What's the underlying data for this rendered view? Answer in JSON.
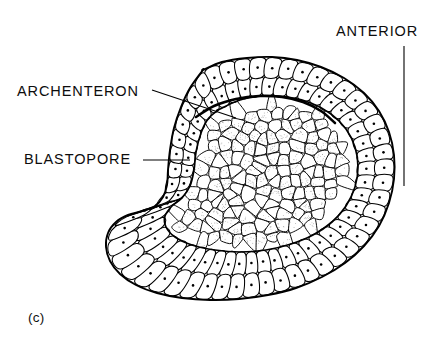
{
  "figure": {
    "panel_letter": "(c)",
    "background_color": "#ffffff",
    "ink_color": "#000000",
    "stipple_color": "#8a8a8a"
  },
  "labels": [
    {
      "id": "archenteron",
      "text": "ARCHENTERON",
      "text_x": 17,
      "text_y": 84,
      "leader": {
        "x1": 152,
        "y1": 90,
        "x2": 236,
        "y2": 118
      }
    },
    {
      "id": "blastopore",
      "text": "BLASTOPORE",
      "text_x": 24,
      "text_y": 152,
      "leader": {
        "x1": 143,
        "y1": 160,
        "x2": 190,
        "y2": 160
      }
    },
    {
      "id": "anterior",
      "text": "ANTERIOR",
      "text_x": 336,
      "text_y": 24,
      "leader": {
        "x1": 404,
        "y1": 46,
        "x2": 404,
        "y2": 186
      }
    }
  ],
  "drawing": {
    "outer_outline": [
      [
        203,
        70
      ],
      [
        222,
        62
      ],
      [
        247,
        58
      ],
      [
        272,
        57
      ],
      [
        297,
        60
      ],
      [
        321,
        67
      ],
      [
        344,
        78
      ],
      [
        364,
        93
      ],
      [
        379,
        111
      ],
      [
        389,
        132
      ],
      [
        394,
        155
      ],
      [
        394,
        179
      ],
      [
        389,
        203
      ],
      [
        379,
        226
      ],
      [
        364,
        246
      ],
      [
        345,
        263
      ],
      [
        322,
        277
      ],
      [
        296,
        288
      ],
      [
        268,
        295
      ],
      [
        239,
        299
      ],
      [
        210,
        300
      ],
      [
        182,
        298
      ],
      [
        157,
        293
      ],
      [
        136,
        285
      ],
      [
        120,
        274
      ],
      [
        110,
        261
      ],
      [
        106,
        247
      ],
      [
        108,
        233
      ],
      [
        116,
        222
      ],
      [
        128,
        215
      ],
      [
        142,
        211
      ],
      [
        155,
        206
      ],
      [
        163,
        197
      ],
      [
        167,
        185
      ],
      [
        168,
        170
      ],
      [
        170,
        150
      ],
      [
        174,
        128
      ],
      [
        181,
        107
      ],
      [
        190,
        88
      ],
      [
        203,
        70
      ]
    ],
    "inner_mass_outline": [
      [
        218,
        110
      ],
      [
        240,
        100
      ],
      [
        264,
        96
      ],
      [
        288,
        97
      ],
      [
        311,
        103
      ],
      [
        331,
        114
      ],
      [
        346,
        129
      ],
      [
        355,
        147
      ],
      [
        358,
        167
      ],
      [
        355,
        187
      ],
      [
        346,
        206
      ],
      [
        332,
        222
      ],
      [
        313,
        235
      ],
      [
        291,
        244
      ],
      [
        266,
        250
      ],
      [
        240,
        252
      ],
      [
        215,
        250
      ],
      [
        192,
        245
      ],
      [
        175,
        237
      ],
      [
        166,
        227
      ],
      [
        165,
        216
      ],
      [
        172,
        206
      ],
      [
        182,
        198
      ],
      [
        190,
        186
      ],
      [
        194,
        170
      ],
      [
        196,
        152
      ],
      [
        201,
        133
      ],
      [
        208,
        119
      ],
      [
        218,
        110
      ]
    ],
    "archenteron_roof": [
      [
        196,
        117
      ],
      [
        214,
        106
      ],
      [
        236,
        99
      ],
      [
        259,
        96
      ],
      [
        282,
        97
      ],
      [
        303,
        102
      ],
      [
        321,
        111
      ],
      [
        335,
        123
      ]
    ],
    "epithelium": {
      "outer_row_cells": 52,
      "inner_row_cells": 44,
      "cell_has_nucleus_dot": true,
      "nucleus_dot_radius": 1.3
    },
    "endoderm": {
      "approx_cell_count": 145,
      "stippled": true,
      "cell_style": "irregular-polygon"
    }
  }
}
